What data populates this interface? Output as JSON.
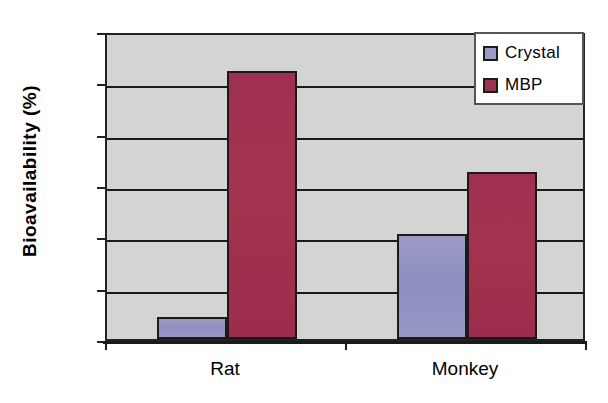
{
  "chart_data": {
    "type": "bar",
    "title": "",
    "subtitle": "",
    "xlabel": "",
    "ylabel": "Bioavailability (%)",
    "categories": [
      "Rat",
      "Monkey"
    ],
    "series": [
      {
        "name": "Crystal",
        "color": "#9a9ac4",
        "values": [
          4.3,
          20.5
        ]
      },
      {
        "name": "MBP",
        "color": "#9e3050",
        "values": [
          52.2,
          32.6
        ]
      }
    ],
    "ylim": [
      0,
      60
    ],
    "ytick_step": 10,
    "yticks": [
      "0",
      "10",
      "20",
      "30",
      "40",
      "50",
      "60"
    ],
    "grid": true,
    "grid_axis": "y",
    "legend_position": "top-right",
    "legend_entries": [
      "Crystal",
      "MBP"
    ],
    "plot_background": "#d4d4d4",
    "axis_color": "#1a1a1a"
  }
}
